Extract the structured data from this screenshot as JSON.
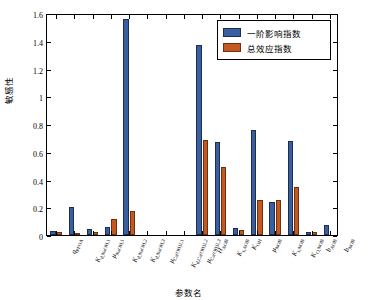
{
  "chart_data": {
    "type": "bar",
    "title": "",
    "xlabel": "参数名",
    "ylabel": "敏感性",
    "ylim": [
      0,
      1.6
    ],
    "yticks": [
      "0",
      "0.2",
      "0.4",
      "0.6",
      "0.8",
      "1",
      "1.2",
      "1.4",
      "1.6"
    ],
    "grid": false,
    "legend_position": "top-right",
    "categories": [
      "q_PFOA",
      "K_d,NaOH,1",
      "μ_NaOH,1",
      "K_d,NaOH,2",
      "K_d,NaOH,3",
      "μ_Ca(OH)2,1",
      "K_d,Ca(OH)2,2",
      "μ_Ca(OH)2,3",
      "H_AOB",
      "K_s,AOB",
      "K_OH",
      "μ_NOB",
      "K_s,NOB",
      "K_O,NOB",
      "b_AOB",
      "b_NOB"
    ],
    "series": [
      {
        "name": "一阶影响指数",
        "color": "#3a5fa0",
        "values": [
          0.03,
          0.2,
          0.04,
          0.06,
          1.555,
          0.0,
          0.0,
          0.0,
          1.37,
          0.67,
          0.05,
          0.755,
          0.24,
          0.675,
          0.02,
          0.075
        ]
      },
      {
        "name": "总效应指数",
        "color": "#c4591f",
        "values": [
          0.025,
          0.015,
          0.025,
          0.115,
          0.175,
          0.0,
          0.0,
          0.0,
          0.685,
          0.49,
          0.035,
          0.25,
          0.25,
          0.345,
          0.025,
          0.0
        ]
      }
    ]
  },
  "legend": {
    "items": [
      {
        "label": "一阶影响指数"
      },
      {
        "label": "总效应指数"
      }
    ]
  },
  "axis": {
    "y_title": "敏感性",
    "x_title": "参数名"
  },
  "xlabels_html": [
    "<i>q</i><sub>PFOA</sub>",
    "<i>K</i><sub>d,NaOH,1</sub>",
    "<i>μ</i><sub>NaOH,1</sub>",
    "<i>K</i><sub>d,NaOH,2</sub>",
    "<i>K</i><sub>d,NaOH,3</sub>",
    "<i>μ</i><sub>Ca(OH)2,1</sub>",
    "<i>K</i><sub>d,Ca(OH)2,2</sub>",
    "<i>μ</i><sub>Ca(OH)2,3</sub>",
    "<i>H</i><sub>AOB</sub>",
    "<i>K</i><sub>s,AOB</sub>",
    "<i>K</i><sub>OH</sub>",
    "<i>μ</i><sub>NOB</sub>",
    "<i>K</i><sub>s,NOB</sub>",
    "<i>K</i><sub>O,NOB</sub>",
    "<i>b</i><sub>AOB</sub>",
    "<i>b</i><sub>NOB</sub>"
  ]
}
